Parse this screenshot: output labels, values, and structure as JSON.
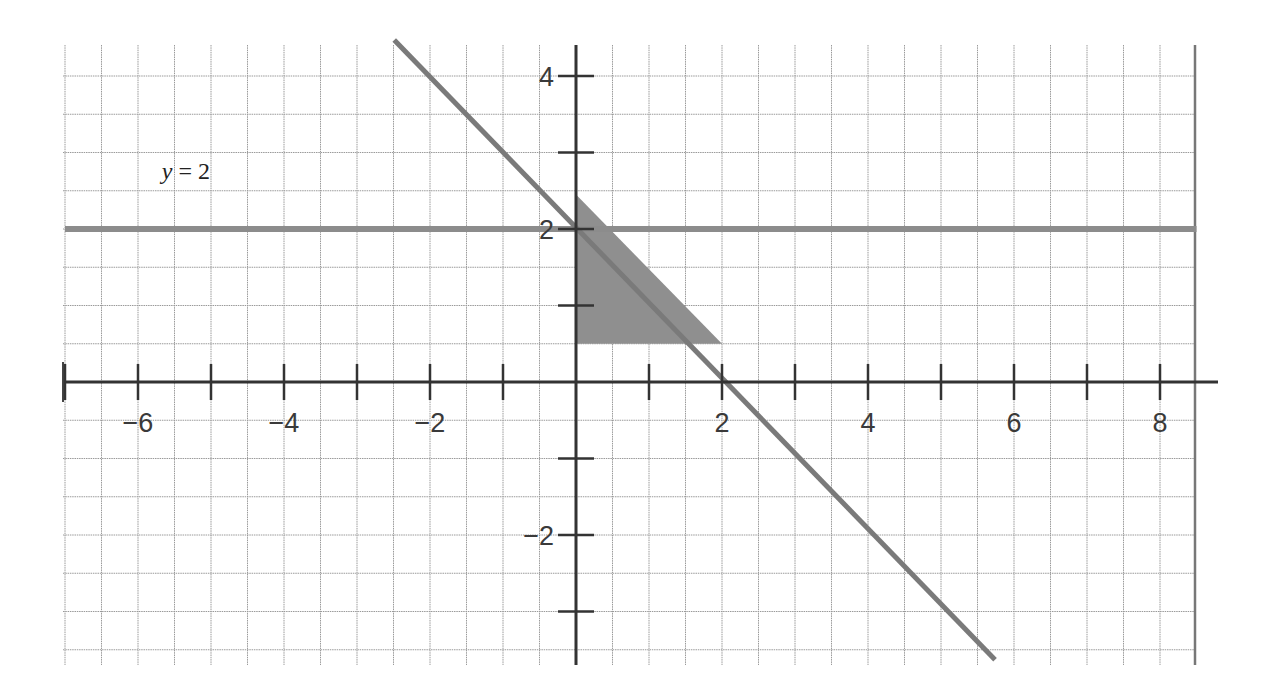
{
  "chart_data": {
    "type": "line",
    "title": "",
    "xlabel": "",
    "ylabel": "",
    "xlim": [
      -7.0,
      8.5
    ],
    "ylim": [
      -3.7,
      4.4
    ],
    "grid": true,
    "grid_step": 0.5,
    "x_ticks": [
      -7,
      -6,
      -5,
      -4,
      -3,
      -2,
      -1,
      1,
      2,
      3,
      4,
      5,
      6,
      7,
      8
    ],
    "x_tick_labels": [
      {
        "value": -6,
        "label": "−6"
      },
      {
        "value": -4,
        "label": "−4"
      },
      {
        "value": -2,
        "label": "−2"
      },
      {
        "value": 2,
        "label": "2"
      },
      {
        "value": 4,
        "label": "4"
      },
      {
        "value": 6,
        "label": "6"
      },
      {
        "value": 8,
        "label": "8"
      }
    ],
    "y_ticks": [
      -3,
      -2,
      -1,
      1,
      2,
      3,
      4
    ],
    "y_tick_labels": [
      {
        "value": 4,
        "label": "4"
      },
      {
        "value": 2,
        "label": "2"
      },
      {
        "value": -2,
        "label": "−2"
      }
    ],
    "series": [
      {
        "name": "y = 2",
        "kind": "horizontal-line",
        "points": [
          [
            -7.0,
            2.0
          ],
          [
            8.5,
            2.0
          ]
        ],
        "color": "#8c8c8c"
      },
      {
        "name": "y = -x + 2",
        "kind": "line",
        "points": [
          [
            -2.49,
            4.47
          ],
          [
            5.74,
            -3.63
          ]
        ],
        "color": "#7a7a7a"
      }
    ],
    "shaded_region": {
      "name": "feasible-region",
      "vertices": [
        [
          0,
          2.45
        ],
        [
          0,
          0.5
        ],
        [
          2,
          0.5
        ]
      ],
      "color": "#8f8f8f"
    },
    "annotations": [
      {
        "text": "y = 2",
        "x": -5.4,
        "y": 2.7
      }
    ]
  }
}
